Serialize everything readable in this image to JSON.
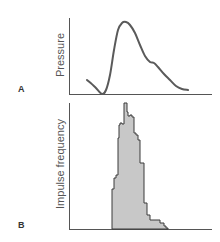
{
  "chart_data": [
    {
      "type": "line",
      "panel": "A",
      "title": "",
      "xlabel": "",
      "ylabel": "Pressure",
      "grid": false,
      "legend": null,
      "series": [
        {
          "name": "Pressure",
          "points_px": [
            [
              87,
              80
            ],
            [
              95,
              87
            ],
            [
              102,
              94
            ],
            [
              106,
              90
            ],
            [
              110,
              75
            ],
            [
              114,
              50
            ],
            [
              118,
              30
            ],
            [
              122,
              23
            ],
            [
              126,
              22
            ],
            [
              130,
              25
            ],
            [
              135,
              33
            ],
            [
              140,
              45
            ],
            [
              145,
              56
            ],
            [
              150,
              62
            ],
            [
              154,
              63
            ],
            [
              158,
              67
            ],
            [
              164,
              74
            ],
            [
              170,
              80
            ],
            [
              176,
              86
            ],
            [
              182,
              89
            ],
            [
              188,
              90
            ]
          ]
        }
      ],
      "annotations": []
    },
    {
      "type": "bar",
      "panel": "B",
      "subtype": "histogram",
      "title": "",
      "xlabel": "",
      "ylabel": "Impulse frequency",
      "grid": false,
      "legend": null,
      "bins_px": [
        {
          "x0": 112,
          "x1": 114,
          "top": 189
        },
        {
          "x0": 114,
          "x1": 116,
          "top": 178
        },
        {
          "x0": 116,
          "x1": 118,
          "top": 175
        },
        {
          "x0": 118,
          "x1": 119,
          "top": 138
        },
        {
          "x0": 119,
          "x1": 120,
          "top": 125
        },
        {
          "x0": 120,
          "x1": 122,
          "top": 123
        },
        {
          "x0": 122,
          "x1": 124,
          "top": 124
        },
        {
          "x0": 124,
          "x1": 125,
          "top": 103
        },
        {
          "x0": 125,
          "x1": 127,
          "top": 103
        },
        {
          "x0": 127,
          "x1": 128,
          "top": 112
        },
        {
          "x0": 128,
          "x1": 130,
          "top": 116
        },
        {
          "x0": 130,
          "x1": 132,
          "top": 115
        },
        {
          "x0": 132,
          "x1": 134,
          "top": 117
        },
        {
          "x0": 134,
          "x1": 136,
          "top": 133
        },
        {
          "x0": 136,
          "x1": 138,
          "top": 135
        },
        {
          "x0": 138,
          "x1": 140,
          "top": 140
        },
        {
          "x0": 140,
          "x1": 144,
          "top": 163
        },
        {
          "x0": 144,
          "x1": 147,
          "top": 203
        },
        {
          "x0": 147,
          "x1": 150,
          "top": 215
        },
        {
          "x0": 150,
          "x1": 160,
          "top": 220
        },
        {
          "x0": 160,
          "x1": 164,
          "top": 223
        },
        {
          "x0": 164,
          "x1": 166,
          "top": 226
        },
        {
          "x0": 166,
          "x1": 168,
          "top": 228
        }
      ],
      "fill": "#c8c8c8",
      "annotations": []
    }
  ],
  "labels": {
    "panel_a": "A",
    "panel_b": "B",
    "ylabel_a": "Pressure",
    "ylabel_b": "Impulse frequency"
  },
  "colors": {
    "axis": "#555555",
    "curve": "#5a5a5a",
    "histogram_fill": "#c8c8c8",
    "histogram_stroke": "#3a3a3a",
    "label": "#333333"
  }
}
